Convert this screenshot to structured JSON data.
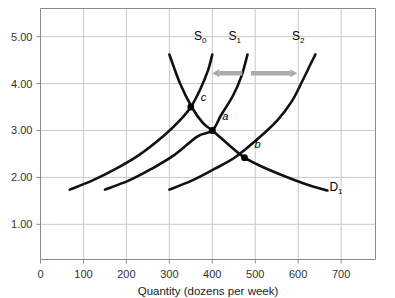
{
  "chart_data": {
    "type": "line",
    "title": "",
    "xlabel": "Quantity (dozens per week)",
    "ylabel": "",
    "xlim": [
      0,
      780
    ],
    "ylim": [
      0.25,
      5.6
    ],
    "grid": true,
    "legend": "inline-curve-labels",
    "xticks": [
      "0",
      "100",
      "200",
      "300",
      "400",
      "500",
      "600",
      "700"
    ],
    "xtick_values": [
      0,
      100,
      200,
      300,
      400,
      500,
      600,
      700
    ],
    "yticks": [
      "1.00",
      "2.00",
      "3.00",
      "4.00",
      "5.00"
    ],
    "ytick_values": [
      1.0,
      2.0,
      3.0,
      4.0,
      5.0
    ],
    "series": [
      {
        "name": "S0",
        "label": "S",
        "subscript": "0",
        "label_x": 372,
        "label_y": 4.92,
        "points": [
          [
            68,
            1.74
          ],
          [
            120,
            1.93
          ],
          [
            175,
            2.18
          ],
          [
            230,
            2.48
          ],
          [
            285,
            2.87
          ],
          [
            325,
            3.22
          ],
          [
            350,
            3.5
          ],
          [
            372,
            3.88
          ],
          [
            390,
            4.28
          ],
          [
            400,
            4.62
          ]
        ]
      },
      {
        "name": "S1",
        "label": "S",
        "subscript": "1",
        "label_x": 452,
        "label_y": 4.92,
        "points": [
          [
            150,
            1.74
          ],
          [
            205,
            1.93
          ],
          [
            258,
            2.18
          ],
          [
            312,
            2.48
          ],
          [
            365,
            2.87
          ],
          [
            400,
            3.0
          ],
          [
            420,
            3.32
          ],
          [
            448,
            3.74
          ],
          [
            468,
            4.16
          ],
          [
            482,
            4.62
          ]
        ]
      },
      {
        "name": "S2",
        "label": "S",
        "subscript": "2",
        "label_x": 600,
        "label_y": 4.92,
        "points": [
          [
            300,
            1.74
          ],
          [
            352,
            1.93
          ],
          [
            405,
            2.18
          ],
          [
            455,
            2.44
          ],
          [
            512,
            2.87
          ],
          [
            552,
            3.22
          ],
          [
            585,
            3.62
          ],
          [
            610,
            4.06
          ],
          [
            628,
            4.4
          ],
          [
            640,
            4.62
          ]
        ]
      },
      {
        "name": "D1",
        "label": "D",
        "subscript": "1",
        "label_x": 688,
        "label_y": 1.7,
        "points": [
          [
            300,
            4.62
          ],
          [
            325,
            4.0
          ],
          [
            352,
            3.5
          ],
          [
            378,
            3.16
          ],
          [
            400,
            3.0
          ],
          [
            440,
            2.68
          ],
          [
            475,
            2.42
          ],
          [
            520,
            2.21
          ],
          [
            570,
            2.02
          ],
          [
            620,
            1.85
          ],
          [
            668,
            1.72
          ]
        ]
      }
    ],
    "annotations": [
      {
        "name": "point-a",
        "label": "a",
        "x": 400,
        "y": 3.0,
        "label_dx": 10,
        "label_dy": -10
      },
      {
        "name": "point-b",
        "label": "b",
        "x": 475,
        "y": 2.42,
        "label_dx": 10,
        "label_dy": -10
      },
      {
        "name": "point-c",
        "label": "c",
        "x": 350,
        "y": 3.5,
        "label_dx": 10,
        "label_dy": -6
      }
    ],
    "arrows": [
      {
        "name": "shift-left-arrow",
        "from_x": 470,
        "to_x": 400,
        "y": 4.22,
        "direction": "left"
      },
      {
        "name": "shift-right-arrow",
        "from_x": 490,
        "to_x": 598,
        "y": 4.22,
        "direction": "right"
      }
    ],
    "colors": {
      "curve": "#111111",
      "grid": "#c9c9c9",
      "axis": "#8a8a8a",
      "arrow": "#aaaaaa",
      "background": "#ffffff",
      "text": "#1a1a1a"
    }
  }
}
